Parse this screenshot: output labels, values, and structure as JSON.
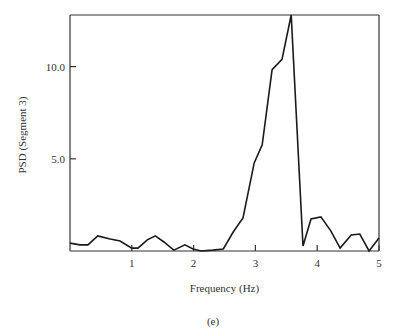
{
  "chart_data": {
    "type": "line",
    "title": "",
    "caption": "(e)",
    "xlabel": "Frequency (Hz)",
    "ylabel": "PSD (Segment 3)",
    "xlim": [
      0,
      5
    ],
    "ylim": [
      0,
      12.8
    ],
    "grid": false,
    "legend": "none",
    "xticks": [
      {
        "value": 1,
        "label": "1"
      },
      {
        "value": 2,
        "label": "2"
      },
      {
        "value": 3,
        "label": "3"
      },
      {
        "value": 4,
        "label": "4"
      },
      {
        "value": 5,
        "label": "5"
      }
    ],
    "yticks": [
      {
        "value": 5.0,
        "label": "5.0"
      },
      {
        "value": 10.0,
        "label": "10.0"
      }
    ],
    "series": [
      {
        "name": "PSD Segment 3",
        "color": "#1a1a1a",
        "x": [
          0.0,
          0.16,
          0.29,
          0.45,
          0.65,
          0.81,
          1.0,
          1.1,
          1.25,
          1.38,
          1.52,
          1.68,
          1.86,
          1.99,
          2.12,
          2.31,
          2.48,
          2.64,
          2.8,
          2.98,
          3.11,
          3.27,
          3.43,
          3.58,
          3.77,
          3.9,
          4.06,
          4.22,
          4.37,
          4.55,
          4.69,
          4.84,
          5.0
        ],
        "y": [
          0.43,
          0.33,
          0.33,
          0.82,
          0.65,
          0.54,
          0.16,
          0.16,
          0.6,
          0.82,
          0.49,
          0.05,
          0.33,
          0.11,
          0.0,
          0.05,
          0.11,
          1.03,
          1.79,
          4.78,
          5.76,
          9.84,
          10.4,
          12.8,
          0.27,
          1.74,
          1.85,
          1.09,
          0.16,
          0.87,
          0.92,
          0.0,
          0.71
        ]
      }
    ]
  }
}
